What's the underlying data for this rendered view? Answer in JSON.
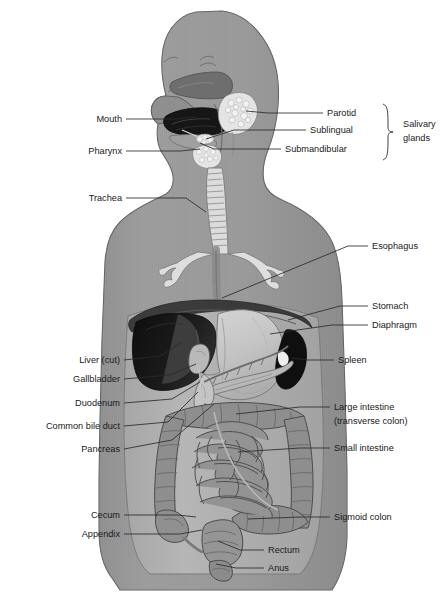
{
  "figure": {
    "orientation": "anterior view of torso with left-facing head profile",
    "palette": {
      "background": "#ffffff",
      "body_fill": "#9b9b9b",
      "body_shadow": "#8a8a8a",
      "body_outline": "#5d5d5d",
      "abdomen_cavity": "#b3b3b3",
      "liver_dark": "#141414",
      "liver_mid": "#4a4a4a",
      "spleen_dark": "#111111",
      "stomach_fill": "#c9c9c9",
      "intestine_fill": "#9a9a9a",
      "intestine_outline": "#4f4f4f",
      "trachea_fill": "#d8d8d8",
      "mouth_dark": "#1b1b1b",
      "nasal_dark": "#6a6a6a",
      "gland_fill": "#e2e2e2",
      "pancreas_fill": "#c2c2c2",
      "label_text": "#1a1a1a",
      "leader_line": "#2b2b2b"
    }
  },
  "labels_left": [
    {
      "id": "mouth",
      "text": "Mouth",
      "text_x": 122,
      "text_y": 122,
      "line": [
        [
          126,
          119
        ],
        [
          176,
          119
        ],
        [
          196,
          117
        ]
      ]
    },
    {
      "id": "pharynx",
      "text": "Pharynx",
      "text_x": 122,
      "text_y": 154,
      "line": [
        [
          126,
          151
        ],
        [
          180,
          151
        ],
        [
          200,
          149
        ]
      ]
    },
    {
      "id": "trachea",
      "text": "Trachea",
      "text_x": 122,
      "text_y": 201,
      "line": [
        [
          126,
          198
        ],
        [
          186,
          198
        ],
        [
          206,
          212
        ]
      ]
    },
    {
      "id": "liver-cut",
      "text": "Liver (cut)",
      "text_x": 120,
      "text_y": 363,
      "line": [
        [
          124,
          360
        ],
        [
          160,
          356
        ],
        [
          182,
          342
        ]
      ]
    },
    {
      "id": "gallbladder",
      "text": "Gallbladder",
      "text_x": 120,
      "text_y": 382,
      "line": [
        [
          124,
          379
        ],
        [
          170,
          375
        ],
        [
          196,
          364
        ]
      ]
    },
    {
      "id": "duodenum",
      "text": "Duodenum",
      "text_x": 120,
      "text_y": 406,
      "line": [
        [
          124,
          403
        ],
        [
          172,
          399
        ],
        [
          200,
          382
        ]
      ]
    },
    {
      "id": "common-bile-duct",
      "text": "Common bile duct",
      "text_x": 120,
      "text_y": 429,
      "line": [
        [
          124,
          426
        ],
        [
          168,
          422
        ],
        [
          198,
          392
        ]
      ]
    },
    {
      "id": "pancreas",
      "text": "Pancreas",
      "text_x": 120,
      "text_y": 452,
      "line": [
        [
          124,
          449
        ],
        [
          172,
          440
        ],
        [
          214,
          404
        ]
      ]
    },
    {
      "id": "cecum",
      "text": "Cecum",
      "text_x": 120,
      "text_y": 518,
      "line": [
        [
          124,
          515
        ],
        [
          178,
          515
        ],
        [
          196,
          517
        ]
      ]
    },
    {
      "id": "appendix",
      "text": "Appendix",
      "text_x": 120,
      "text_y": 537,
      "line": [
        [
          124,
          534
        ],
        [
          180,
          534
        ],
        [
          202,
          530
        ]
      ]
    }
  ],
  "labels_right": [
    {
      "id": "parotid",
      "text": "Parotid",
      "text_x": 327,
      "text_y": 116,
      "line": [
        [
          323,
          113
        ],
        [
          268,
          113
        ],
        [
          246,
          111
        ]
      ]
    },
    {
      "id": "sublingual",
      "text": "Sublingual",
      "text_x": 310,
      "text_y": 133,
      "line": [
        [
          306,
          130
        ],
        [
          234,
          130
        ],
        [
          206,
          139
        ]
      ]
    },
    {
      "id": "submandibular",
      "text": "Submandibular",
      "text_x": 285,
      "text_y": 152,
      "line": [
        [
          281,
          149
        ],
        [
          214,
          149
        ],
        [
          200,
          143
        ]
      ]
    },
    {
      "id": "esophagus",
      "text": "Esophagus",
      "text_x": 372,
      "text_y": 249,
      "line": [
        [
          368,
          246
        ],
        [
          348,
          246
        ],
        [
          222,
          298
        ]
      ]
    },
    {
      "id": "stomach",
      "text": "Stomach",
      "text_x": 372,
      "text_y": 309,
      "line": [
        [
          368,
          306
        ],
        [
          340,
          306
        ],
        [
          288,
          320
        ]
      ]
    },
    {
      "id": "diaphragm",
      "text": "Diaphragm",
      "text_x": 372,
      "text_y": 328,
      "line": [
        [
          368,
          325
        ],
        [
          332,
          325
        ],
        [
          270,
          334
        ]
      ]
    },
    {
      "id": "spleen",
      "text": "Spleen",
      "text_x": 338,
      "text_y": 363,
      "line": [
        [
          334,
          360
        ],
        [
          308,
          360
        ],
        [
          292,
          358
        ]
      ]
    },
    {
      "id": "large-intestine",
      "text": "Large intestine",
      "text_x": 334,
      "text_y": 410,
      "line": [
        [
          330,
          407
        ],
        [
          300,
          407
        ],
        [
          236,
          414
        ]
      ]
    },
    {
      "id": "transverse-colon",
      "text": "(transverse colon)",
      "text_x": 334,
      "text_y": 424,
      "line": null
    },
    {
      "id": "small-intestine",
      "text": "Small intestine",
      "text_x": 334,
      "text_y": 451,
      "line": [
        [
          330,
          448
        ],
        [
          300,
          448
        ],
        [
          238,
          452
        ]
      ]
    },
    {
      "id": "sigmoid-colon",
      "text": "Sigmoid colon",
      "text_x": 334,
      "text_y": 520,
      "line": [
        [
          330,
          517
        ],
        [
          300,
          517
        ],
        [
          248,
          519
        ]
      ]
    },
    {
      "id": "rectum",
      "text": "Rectum",
      "text_x": 268,
      "text_y": 553,
      "line": [
        [
          264,
          550
        ],
        [
          240,
          550
        ],
        [
          218,
          541
        ]
      ]
    },
    {
      "id": "anus",
      "text": "Anus",
      "text_x": 268,
      "text_y": 571,
      "line": [
        [
          264,
          568
        ],
        [
          236,
          568
        ],
        [
          216,
          564
        ]
      ]
    }
  ],
  "group_label": {
    "id": "salivary-glands",
    "line1": "Salivary",
    "line2": "glands",
    "text_x": 403,
    "text_y1": 127,
    "text_y2": 141,
    "brace_x": 388,
    "brace_top": 104,
    "brace_bottom": 160
  },
  "organs": [
    {
      "id": "brain-cranium",
      "name": "Cranium / head profile"
    },
    {
      "id": "nasal-cavity",
      "name": "Nasal cavity"
    },
    {
      "id": "mouth-cavity",
      "name": "Oral cavity (mouth)"
    },
    {
      "id": "tongue",
      "name": "Tongue"
    },
    {
      "id": "parotid-gland",
      "name": "Parotid salivary gland"
    },
    {
      "id": "sublingual-gland",
      "name": "Sublingual salivary gland"
    },
    {
      "id": "submandibular-gland",
      "name": "Submandibular salivary gland"
    },
    {
      "id": "pharynx-organ",
      "name": "Pharynx"
    },
    {
      "id": "trachea-organ",
      "name": "Trachea with cartilage rings"
    },
    {
      "id": "bronchi",
      "name": "Bronchial tree"
    },
    {
      "id": "esophagus-organ",
      "name": "Esophagus"
    },
    {
      "id": "diaphragm-organ",
      "name": "Diaphragm"
    },
    {
      "id": "liver-organ",
      "name": "Liver (cut)"
    },
    {
      "id": "gallbladder-organ",
      "name": "Gallbladder"
    },
    {
      "id": "stomach-organ",
      "name": "Stomach"
    },
    {
      "id": "spleen-organ",
      "name": "Spleen"
    },
    {
      "id": "pancreas-organ",
      "name": "Pancreas"
    },
    {
      "id": "duodenum-organ",
      "name": "Duodenum"
    },
    {
      "id": "small-intestine-organ",
      "name": "Small intestine"
    },
    {
      "id": "ascending-colon",
      "name": "Ascending colon"
    },
    {
      "id": "transverse-colon-organ",
      "name": "Transverse colon"
    },
    {
      "id": "descending-colon",
      "name": "Descending colon"
    },
    {
      "id": "sigmoid-colon-organ",
      "name": "Sigmoid colon"
    },
    {
      "id": "cecum-organ",
      "name": "Cecum"
    },
    {
      "id": "appendix-organ",
      "name": "Appendix"
    },
    {
      "id": "rectum-organ",
      "name": "Rectum"
    },
    {
      "id": "anus-organ",
      "name": "Anus"
    }
  ]
}
